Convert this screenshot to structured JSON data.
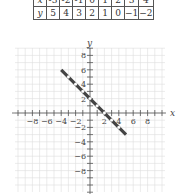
{
  "table": {
    "rows": [
      {
        "label": "x",
        "values": [
          "-3",
          "-2",
          "-1",
          "0",
          "1",
          "2",
          "3",
          "4"
        ]
      },
      {
        "label": "y",
        "values": [
          "5",
          "4",
          "3",
          "2",
          "1",
          "0",
          "−1",
          "−2"
        ]
      }
    ]
  },
  "graph": {
    "x_axis_label": "x",
    "y_axis_label": "y",
    "x_tick_labels": [
      "−8",
      "−6",
      "−4",
      "−2",
      "2",
      "4",
      "6",
      "8"
    ],
    "y_tick_labels": [
      "8",
      "6",
      "4",
      "2",
      "−2",
      "−4",
      "−6",
      "−8"
    ],
    "line": {
      "equation": "y = -x + 2",
      "from": [
        -4,
        6
      ],
      "to": [
        5,
        -3
      ],
      "color": "#444444"
    },
    "points": [
      [
        -3,
        5
      ],
      [
        -2,
        4
      ],
      [
        -1,
        3
      ],
      [
        0,
        2
      ],
      [
        1,
        1
      ],
      [
        2,
        0
      ],
      [
        3,
        -1
      ],
      [
        4,
        -2
      ]
    ]
  },
  "chart_data": {
    "type": "line",
    "title": "",
    "xlabel": "x",
    "ylabel": "y",
    "x": [
      -3,
      -2,
      -1,
      0,
      1,
      2,
      3,
      4
    ],
    "series": [
      {
        "name": "y = -x + 2",
        "values": [
          5,
          4,
          3,
          2,
          1,
          0,
          -1,
          -2
        ]
      }
    ],
    "xlim": [
      -10,
      10
    ],
    "ylim": [
      -9,
      9
    ],
    "grid": true
  }
}
